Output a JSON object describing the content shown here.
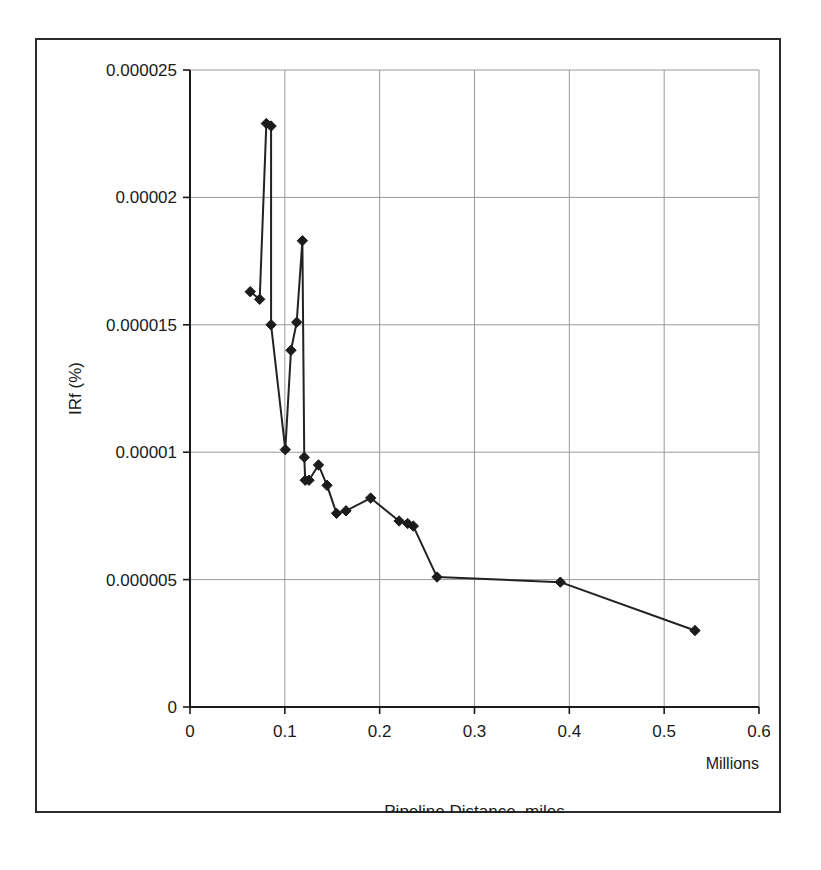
{
  "chart_data": {
    "type": "line",
    "title": "",
    "xlabel": "Pipeline Distance, miles",
    "ylabel": "IRf (%)",
    "x_unit_note": "Millions",
    "xlim": [
      0,
      0.6
    ],
    "ylim": [
      0,
      2.5e-05
    ],
    "grid": true,
    "legend": "none",
    "marker": "diamond",
    "x_ticks": [
      "0",
      "0.1",
      "0.2",
      "0.3",
      "0.4",
      "0.5",
      "0.6"
    ],
    "x_tick_values": [
      0,
      0.1,
      0.2,
      0.3,
      0.4,
      0.5,
      0.6
    ],
    "y_ticks": [
      "0",
      "0.000005",
      "0.00001",
      "0.000015",
      "0.00002",
      "0.000025"
    ],
    "y_tick_values": [
      0,
      5e-06,
      1e-05,
      1.5e-05,
      2e-05,
      2.5e-05
    ],
    "series": [
      {
        "name": "IRf",
        "x": [
          0.0635,
          0.0735,
          0.0805,
          0.0855,
          0.0855,
          0.1005,
          0.1065,
          0.1125,
          0.1185,
          0.1205,
          0.1215,
          0.1255,
          0.1355,
          0.1445,
          0.1545,
          0.1645,
          0.1905,
          0.2205,
          0.2295,
          0.2355,
          0.2605,
          0.3905,
          0.5325
        ],
        "y": [
          1.63e-05,
          1.6e-05,
          2.29e-05,
          2.28e-05,
          1.5e-05,
          1.01e-05,
          1.4e-05,
          1.51e-05,
          1.83e-05,
          9.8e-06,
          8.9e-06,
          8.9e-06,
          9.5e-06,
          8.7e-06,
          7.6e-06,
          7.7e-06,
          8.2e-06,
          7.3e-06,
          7.2e-06,
          7.1e-06,
          5.1e-06,
          4.9e-06,
          3e-06
        ]
      }
    ]
  },
  "axes": {
    "y_axis_label": "IRf (%)",
    "x_axis_label": "Pipeline Distance, miles",
    "x_axis_unit": "Millions"
  }
}
